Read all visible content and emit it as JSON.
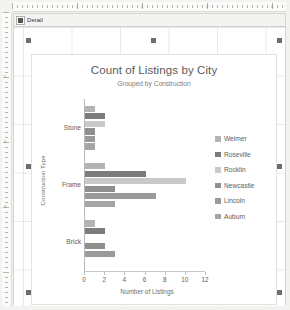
{
  "app": {
    "section_band_label": "Detail",
    "ruler_h_numbers": [
      "1",
      "2",
      "3",
      "4"
    ],
    "ruler_v_numbers": [
      "1",
      "2",
      "3"
    ]
  },
  "chart_data": {
    "type": "bar",
    "orientation": "horizontal",
    "title": "Count of Listings by City",
    "subtitle": "Grouped by Construction",
    "xlabel": "Number of Listings",
    "ylabel": "Construction Type",
    "categories": [
      "Stone",
      "Frame",
      "Brick"
    ],
    "xticks": [
      "0",
      "2",
      "4",
      "6",
      "8",
      "10",
      "12"
    ],
    "xlim": [
      0,
      12
    ],
    "grid": false,
    "legend_position": "right",
    "series": [
      {
        "name": "Weimer",
        "color": "#b3b3b3",
        "values": [
          1,
          2,
          1
        ]
      },
      {
        "name": "Roseville",
        "color": "#7c7c7c",
        "values": [
          2,
          6,
          2
        ]
      },
      {
        "name": "Rocklin",
        "color": "#c9c9c9",
        "values": [
          2,
          10,
          0
        ]
      },
      {
        "name": "Newcastle",
        "color": "#8f8f8f",
        "values": [
          1,
          3,
          2
        ]
      },
      {
        "name": "Lincoln",
        "color": "#9a9a9a",
        "values": [
          1,
          7,
          3
        ]
      },
      {
        "name": "Auburn",
        "color": "#a5a5a5",
        "values": [
          1,
          3,
          0
        ]
      }
    ]
  }
}
